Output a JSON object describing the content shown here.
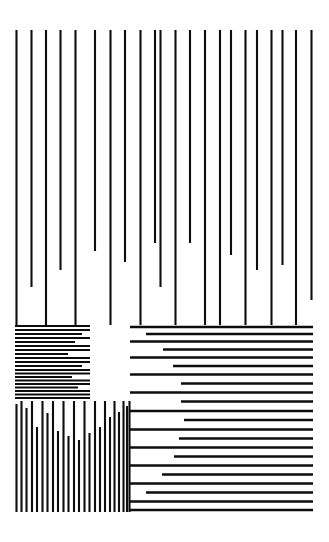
{
  "canvas": {
    "width": 329,
    "height": 542,
    "background": "#ffffff",
    "ink": "#0d0d0d",
    "title": "Abstract Line Composition"
  },
  "artwork": {
    "bounds": {
      "left": 15,
      "top": 30,
      "right": 313,
      "bottom": 512
    },
    "description": "Black-and-white abstract composition of straight ruled lines arranged in four quadrant blocks: vertical hatching above, dense horizontal hatching at mid-left, wide horizontal ruling at right, and vertical hatching at lower left, with a white void at the center.",
    "stroke_color": "#0d0d0d"
  },
  "chart_data": {
    "type": "line",
    "xlabel": "",
    "ylabel": "",
    "xlim": [
      0,
      329
    ],
    "ylim": [
      0,
      542
    ],
    "grid": false,
    "legend": "none",
    "blocks": [
      {
        "name": "top-vertical-block",
        "orientation": "vertical",
        "region": {
          "x": 15,
          "y": 30,
          "width": 298,
          "height": 295
        },
        "count": 22,
        "stroke_width": 2.1,
        "lines": [
          {
            "x": 16.5,
            "y1": 30,
            "y2": 325
          },
          {
            "x": 31.5,
            "y1": 30,
            "y2": 287
          },
          {
            "x": 46.0,
            "y1": 30,
            "y2": 325
          },
          {
            "x": 60.5,
            "y1": 30,
            "y2": 270
          },
          {
            "x": 75.5,
            "y1": 30,
            "y2": 325
          },
          {
            "x": 95.0,
            "y1": 30,
            "y2": 251
          },
          {
            "x": 110.5,
            "y1": 30,
            "y2": 325
          },
          {
            "x": 125.0,
            "y1": 30,
            "y2": 262
          },
          {
            "x": 140.5,
            "y1": 30,
            "y2": 325
          },
          {
            "x": 155.0,
            "y1": 30,
            "y2": 243
          },
          {
            "x": 160.5,
            "y1": 30,
            "y2": 287
          },
          {
            "x": 175.5,
            "y1": 30,
            "y2": 325
          },
          {
            "x": 190.0,
            "y1": 30,
            "y2": 243
          },
          {
            "x": 205.0,
            "y1": 30,
            "y2": 325
          },
          {
            "x": 220.0,
            "y1": 30,
            "y2": 325
          },
          {
            "x": 231.0,
            "y1": 30,
            "y2": 255
          },
          {
            "x": 245.5,
            "y1": 30,
            "y2": 325
          },
          {
            "x": 257.0,
            "y1": 30,
            "y2": 270
          },
          {
            "x": 271.5,
            "y1": 30,
            "y2": 325
          },
          {
            "x": 282.5,
            "y1": 30,
            "y2": 265
          },
          {
            "x": 296.0,
            "y1": 30,
            "y2": 325
          },
          {
            "x": 311.5,
            "y1": 30,
            "y2": 300
          }
        ]
      },
      {
        "name": "mid-left-horizontal-block",
        "orientation": "horizontal",
        "region": {
          "x": 15,
          "y": 324,
          "width": 75,
          "height": 76
        },
        "count": 20,
        "stroke_width": 2.2,
        "lines": [
          {
            "y": 326.0,
            "x1": 15,
            "x2": 90
          },
          {
            "y": 330.0,
            "x1": 15,
            "x2": 90
          },
          {
            "y": 334.0,
            "x1": 15,
            "x2": 82
          },
          {
            "y": 338.0,
            "x1": 15,
            "x2": 90
          },
          {
            "y": 342.0,
            "x1": 15,
            "x2": 75
          },
          {
            "y": 346.0,
            "x1": 15,
            "x2": 90
          },
          {
            "y": 350.0,
            "x1": 15,
            "x2": 90
          },
          {
            "y": 354.0,
            "x1": 15,
            "x2": 68
          },
          {
            "y": 358.0,
            "x1": 15,
            "x2": 90
          },
          {
            "y": 362.0,
            "x1": 15,
            "x2": 90
          },
          {
            "y": 366.0,
            "x1": 15,
            "x2": 82
          },
          {
            "y": 370.0,
            "x1": 15,
            "x2": 90
          },
          {
            "y": 373.5,
            "x1": 15,
            "x2": 90
          },
          {
            "y": 377.0,
            "x1": 15,
            "x2": 72
          },
          {
            "y": 380.5,
            "x1": 15,
            "x2": 90
          },
          {
            "y": 384.0,
            "x1": 15,
            "x2": 90
          },
          {
            "y": 387.5,
            "x1": 15,
            "x2": 78
          },
          {
            "y": 391.0,
            "x1": 15,
            "x2": 90
          },
          {
            "y": 394.5,
            "x1": 15,
            "x2": 90
          },
          {
            "y": 398.0,
            "x1": 15,
            "x2": 90
          }
        ]
      },
      {
        "name": "right-horizontal-block",
        "orientation": "horizontal",
        "region": {
          "x": 130,
          "y": 324,
          "width": 183,
          "height": 188
        },
        "count": 22,
        "stroke_width": 2.4,
        "lines": [
          {
            "y": 327.0,
            "x1": 130,
            "x2": 313
          },
          {
            "y": 334.0,
            "x1": 146,
            "x2": 313
          },
          {
            "y": 341.5,
            "x1": 130,
            "x2": 313
          },
          {
            "y": 349.5,
            "x1": 163,
            "x2": 313
          },
          {
            "y": 357.5,
            "x1": 130,
            "x2": 313
          },
          {
            "y": 366.0,
            "x1": 173,
            "x2": 313
          },
          {
            "y": 374.5,
            "x1": 130,
            "x2": 313
          },
          {
            "y": 383.5,
            "x1": 181,
            "x2": 313
          },
          {
            "y": 392.5,
            "x1": 130,
            "x2": 313
          },
          {
            "y": 401.5,
            "x1": 181,
            "x2": 313
          },
          {
            "y": 411.0,
            "x1": 130,
            "x2": 313
          },
          {
            "y": 420.0,
            "x1": 184,
            "x2": 313
          },
          {
            "y": 429.5,
            "x1": 130,
            "x2": 313
          },
          {
            "y": 438.5,
            "x1": 179,
            "x2": 313
          },
          {
            "y": 447.5,
            "x1": 130,
            "x2": 313
          },
          {
            "y": 456.5,
            "x1": 174,
            "x2": 313
          },
          {
            "y": 465.5,
            "x1": 130,
            "x2": 313
          },
          {
            "y": 474.5,
            "x1": 162,
            "x2": 313
          },
          {
            "y": 483.5,
            "x1": 130,
            "x2": 313
          },
          {
            "y": 492.5,
            "x1": 146,
            "x2": 313
          },
          {
            "y": 501.5,
            "x1": 130,
            "x2": 313
          },
          {
            "y": 510.0,
            "x1": 130,
            "x2": 313
          }
        ]
      },
      {
        "name": "bottom-left-vertical-block",
        "orientation": "vertical",
        "region": {
          "x": 15,
          "y": 400,
          "width": 115,
          "height": 112
        },
        "count": 24,
        "stroke_width": 2.1,
        "lines": [
          {
            "x": 16.5,
            "y1": 404,
            "y2": 512
          },
          {
            "x": 21.5,
            "y1": 401,
            "y2": 512
          },
          {
            "x": 26.5,
            "y1": 408,
            "y2": 512
          },
          {
            "x": 32.0,
            "y1": 401,
            "y2": 512
          },
          {
            "x": 37.0,
            "y1": 427,
            "y2": 512
          },
          {
            "x": 42.5,
            "y1": 401,
            "y2": 512
          },
          {
            "x": 47.5,
            "y1": 413,
            "y2": 512
          },
          {
            "x": 53.0,
            "y1": 401,
            "y2": 512
          },
          {
            "x": 58.0,
            "y1": 431,
            "y2": 512
          },
          {
            "x": 63.5,
            "y1": 401,
            "y2": 512
          },
          {
            "x": 68.5,
            "y1": 436,
            "y2": 512
          },
          {
            "x": 74.0,
            "y1": 401,
            "y2": 512
          },
          {
            "x": 79.0,
            "y1": 440,
            "y2": 512
          },
          {
            "x": 84.5,
            "y1": 401,
            "y2": 512
          },
          {
            "x": 89.5,
            "y1": 433,
            "y2": 512
          },
          {
            "x": 95.0,
            "y1": 401,
            "y2": 512
          },
          {
            "x": 100.0,
            "y1": 427,
            "y2": 512
          },
          {
            "x": 105.0,
            "y1": 401,
            "y2": 512
          },
          {
            "x": 110.0,
            "y1": 417,
            "y2": 512
          },
          {
            "x": 114.5,
            "y1": 401,
            "y2": 512
          },
          {
            "x": 119.0,
            "y1": 412,
            "y2": 512
          },
          {
            "x": 123.5,
            "y1": 401,
            "y2": 512
          },
          {
            "x": 127.0,
            "y1": 406,
            "y2": 512
          },
          {
            "x": 129.5,
            "y1": 401,
            "y2": 512
          }
        ]
      }
    ]
  }
}
